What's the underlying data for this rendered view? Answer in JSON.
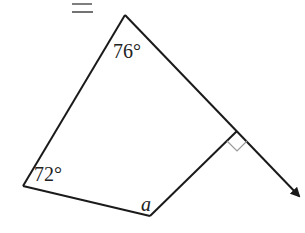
{
  "header": {
    "cropped_text": "y = ?"
  },
  "diagram": {
    "type": "quadrilateral-exterior-angle",
    "stroke_color": "#1a1a1a",
    "right_angle_color": "#999999",
    "angles": [
      {
        "vertex": "top",
        "label": "76°"
      },
      {
        "vertex": "left",
        "label": "72°"
      },
      {
        "vertex": "bottom",
        "label": "a"
      }
    ],
    "right_angle_marker": true,
    "arrow_extension": true
  }
}
